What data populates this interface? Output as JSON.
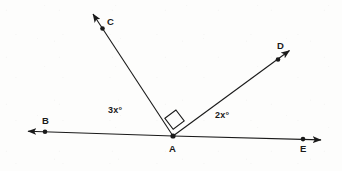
{
  "figure": {
    "type": "geometry-diagram",
    "background_color": "#fdfdfc",
    "stroke_color": "#1a1a1a",
    "vertex": {
      "label": "A",
      "x": 173,
      "y": 136
    },
    "points": [
      {
        "id": "B",
        "label": "B",
        "x": 45,
        "y": 133,
        "label_x": 44,
        "label_y": 118,
        "label_position": "above"
      },
      {
        "id": "C",
        "label": "C",
        "x": 102,
        "y": 27,
        "label_x": 107,
        "label_y": 13,
        "label_position": "right"
      },
      {
        "id": "D",
        "label": "D",
        "x": 278,
        "y": 60,
        "label_x": 277,
        "label_y": 44,
        "label_position": "above"
      },
      {
        "id": "E",
        "label": "E",
        "x": 303,
        "y": 139,
        "label_x": 301,
        "label_y": 145,
        "label_position": "below"
      },
      {
        "id": "A",
        "label": "A",
        "x": 173,
        "y": 136,
        "label_x": 170,
        "label_y": 143,
        "label_position": "below"
      }
    ],
    "rays": [
      {
        "id": "AB",
        "from": "A",
        "through": "B",
        "tip_x": 24,
        "tip_y": 131,
        "arrow": true
      },
      {
        "id": "AE",
        "from": "A",
        "through": "E",
        "tip_x": 326,
        "tip_y": 140,
        "arrow": true
      },
      {
        "id": "AC",
        "from": "A",
        "through": "C",
        "tip_x": 89,
        "tip_y": 10,
        "arrow": true
      },
      {
        "id": "AD",
        "from": "A",
        "through": "D",
        "tip_x": 294,
        "tip_y": 47,
        "arrow": true
      }
    ],
    "angle_labels": [
      {
        "id": "angle-BAC",
        "text": "3x°",
        "x": 110,
        "y": 108
      },
      {
        "id": "angle-DAE",
        "text": "2x°",
        "x": 217,
        "y": 113
      }
    ],
    "right_angle_mark": {
      "id": "right-angle-CAD",
      "between": "AC and AD",
      "symbol": "square",
      "size": 14
    }
  }
}
